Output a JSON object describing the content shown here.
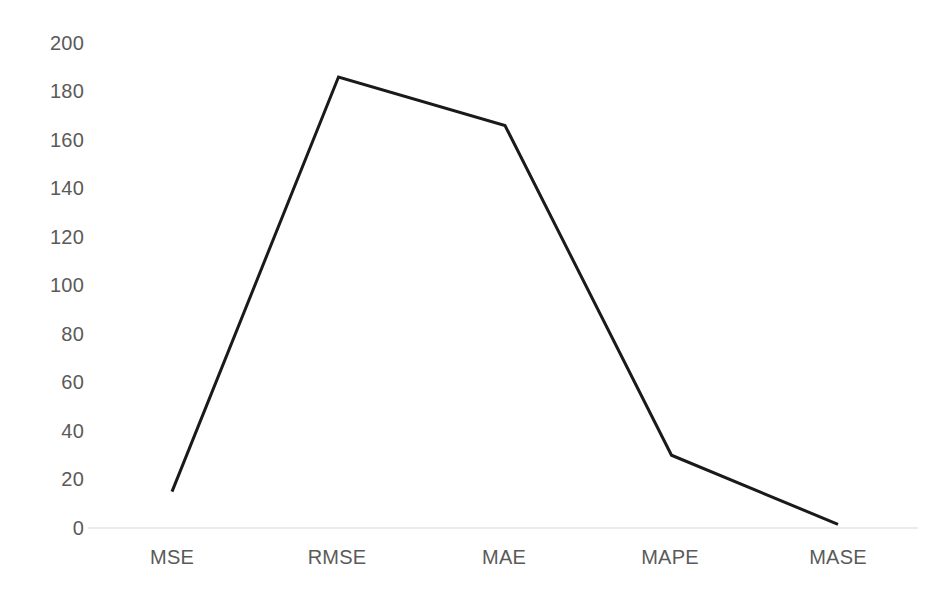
{
  "chart_data": {
    "type": "line",
    "title": "",
    "subtitle": "",
    "xlabel": "",
    "ylabel": "",
    "categories": [
      "MSE",
      "RMSE",
      "MAE",
      "MAPE",
      "MASE"
    ],
    "values": [
      15,
      186,
      166,
      30,
      1.5
    ],
    "series": [
      {
        "name": "",
        "values": [
          15,
          186,
          166,
          30,
          1.5
        ],
        "color": "#1a1a1a",
        "marker": "none",
        "line_width": 3
      }
    ],
    "ylim": [
      0,
      200
    ],
    "ytick_step": 20,
    "ytick_labels": [
      "200",
      "180",
      "160",
      "140",
      "120",
      "100",
      "80",
      "60",
      "40",
      "20",
      "0"
    ],
    "ytick_values": [
      200,
      180,
      160,
      140,
      120,
      100,
      80,
      60,
      40,
      20,
      0
    ],
    "xtick_labels": [
      "MSE",
      "RMSE",
      "MAE",
      "MAPE",
      "MASE"
    ],
    "grid": false,
    "baseline_only": true,
    "legend": "none",
    "legend_position": "none",
    "annotations": [],
    "colors": {
      "line": "#1a1a1a",
      "axis_text": "#5a5a5a",
      "baseline": "#e4e4e4",
      "background": "#ffffff"
    }
  }
}
